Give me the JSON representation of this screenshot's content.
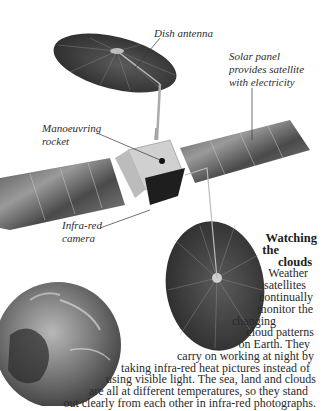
{
  "figure": {
    "subject": "Weather satellite",
    "labels": {
      "dish_antenna": "Dish antenna",
      "solar_panel": [
        "Solar panel",
        "provides satellite",
        "with electricity"
      ],
      "manoeuvring_rocket": [
        "Manoeuvring",
        "rocket"
      ],
      "infra_red_camera": [
        "Infra-red",
        "camera"
      ]
    },
    "colors": {
      "panel_dark": "#3b3b3b",
      "panel_light": "#9a9a9a",
      "body": "#c8c8c8",
      "earth_dark": "#2e2e2e",
      "earth_light": "#bdbdbd"
    }
  },
  "caption": {
    "title_lines": [
      "Watching",
      "the",
      "clouds"
    ],
    "body_lines": [
      "Weather",
      "satellites",
      "continually",
      "monitor the",
      "changing",
      "cloud patterns",
      "on Earth. They",
      "carry on working at night by",
      "taking infra-red heat pictures instead of",
      "using visible light. The sea, land and clouds",
      "are all at different temperatures, so they stand",
      "out clearly from each other in infra-red photographs."
    ]
  }
}
